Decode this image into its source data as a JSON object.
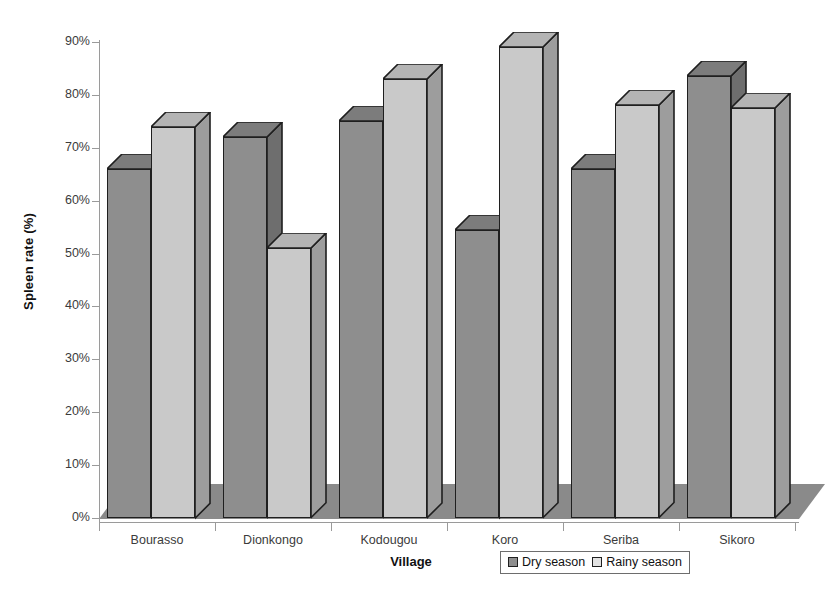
{
  "chart_data": {
    "type": "bar",
    "title": "",
    "xlabel": "Village",
    "ylabel": "Spleen rate (%)",
    "categories": [
      "Bourasso",
      "Dionkongo",
      "Kodougou",
      "Koro",
      "Seriba",
      "Sikoro"
    ],
    "series": [
      {
        "name": "Dry season",
        "values": [
          66,
          72,
          75,
          54.5,
          66,
          83.5
        ],
        "color": "#8e8e8e"
      },
      {
        "name": "Rainy season",
        "values": [
          74,
          51,
          83,
          89,
          78,
          77.5
        ],
        "color": "#c9c9c9"
      }
    ],
    "ylim": [
      0,
      90
    ],
    "ytick_labels": [
      "0%",
      "10%",
      "20%",
      "30%",
      "40%",
      "50%",
      "60%",
      "70%",
      "80%",
      "90%"
    ],
    "ytick_values": [
      0,
      10,
      20,
      30,
      40,
      50,
      60,
      70,
      80,
      90
    ],
    "grid": false,
    "legend_position": "bottom-right",
    "style": "3d-column",
    "colors": {
      "dry_front": "#8e8e8e",
      "dry_side": "#6e6e6e",
      "dry_top": "#7c7c7c",
      "rainy_front": "#c9c9c9",
      "rainy_side": "#9d9d9d",
      "rainy_top": "#b4b4b4",
      "floor": "#8a8a8a",
      "outline": "#1f1f1f",
      "axis": "#9a9a9a",
      "text": "#3b3b3b",
      "background": "#ffffff"
    }
  },
  "legend": {
    "entries": [
      {
        "label": "Dry season"
      },
      {
        "label": "Rainy season"
      }
    ]
  }
}
